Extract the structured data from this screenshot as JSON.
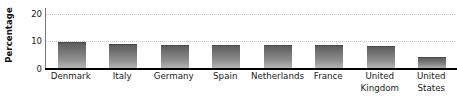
{
  "chart_data": {
    "type": "bar",
    "title": "",
    "subtitle": "",
    "xlabel": "",
    "ylabel": "Percentage",
    "ylim": [
      0,
      22
    ],
    "yticks": [
      0,
      10,
      20
    ],
    "grid": "horizontal-dotted",
    "legend": "none",
    "categories": [
      "Denmark",
      "Italy",
      "Germany",
      "Spain",
      "Netherlands",
      "France",
      "United Kingdom",
      "United States"
    ],
    "category_lines": [
      [
        "Denmark"
      ],
      [
        "Italy"
      ],
      [
        "Germany"
      ],
      [
        "Spain"
      ],
      [
        "Netherlands"
      ],
      [
        "France"
      ],
      [
        "United",
        "Kingdom"
      ],
      [
        "United",
        "States"
      ]
    ],
    "values": [
      9.6,
      9.2,
      8.8,
      8.5,
      8.5,
      8.5,
      8.2,
      4.3
    ],
    "bar_color": "#7a7a7a",
    "bar_gradient_top": "#5d5d5d",
    "bar_gradient_bottom": "#b9b9b9",
    "axis_color": "#000000",
    "gridline_color": "#c9c9c9",
    "background_color": "#ffffff"
  },
  "axis": {
    "y_title": "Percentage",
    "y_tick_labels": [
      "0",
      "10",
      "20"
    ]
  }
}
